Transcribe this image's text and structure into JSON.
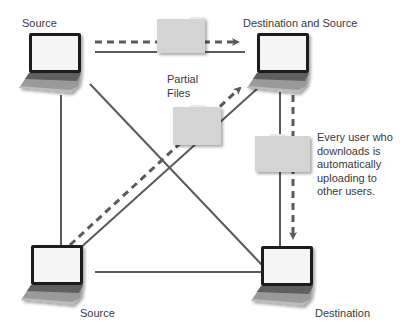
{
  "diagram": {
    "nodes": [
      {
        "id": "top-left",
        "label": "Source"
      },
      {
        "id": "top-right",
        "label": "Destination and Source"
      },
      {
        "id": "bottom-left",
        "label": "Source"
      },
      {
        "id": "bottom-right",
        "label": "Destination"
      }
    ],
    "partial_files_label": "Partial\nFiles",
    "partial_files_line1": "Partial",
    "partial_files_line2": "Files",
    "note_lines": [
      "Every user who",
      "downloads is",
      "automatically",
      "uploading to",
      "other users."
    ],
    "colors": {
      "line": "#5a5a5a",
      "folder_fill": "#d4d4d4",
      "folder_tab": "#e8e8e8",
      "laptop_body": "#8c8c8c",
      "laptop_screen": "#f5f5f5",
      "laptop_bezel": "#1e1e1e"
    },
    "connections": [
      {
        "from": "top-left",
        "to": "top-right",
        "type": "solid"
      },
      {
        "from": "top-left",
        "to": "top-right",
        "type": "dashed-arrow"
      },
      {
        "from": "top-left",
        "to": "bottom-left",
        "type": "solid"
      },
      {
        "from": "top-left",
        "to": "bottom-right",
        "type": "solid"
      },
      {
        "from": "bottom-left",
        "to": "top-right",
        "type": "solid"
      },
      {
        "from": "bottom-left",
        "to": "top-right",
        "type": "dashed-arrow"
      },
      {
        "from": "bottom-left",
        "to": "bottom-right",
        "type": "solid"
      },
      {
        "from": "top-right",
        "to": "bottom-right",
        "type": "solid"
      },
      {
        "from": "top-right",
        "to": "bottom-right",
        "type": "dashed-arrow"
      }
    ]
  }
}
